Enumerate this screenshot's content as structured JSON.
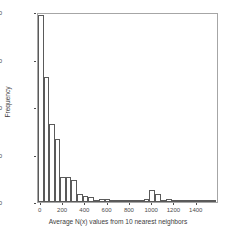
{
  "chart_data": {
    "type": "bar",
    "title": "",
    "subtitle": "",
    "xlabel": "Average N(x) values from 10 nearest neighbors",
    "ylabel": "Frequency",
    "xlim": [
      -25,
      1600
    ],
    "ylim": [
      0,
      10000
    ],
    "grid": false,
    "legend": null,
    "bin_width": 50,
    "xticks": [
      0,
      200,
      400,
      600,
      800,
      1000,
      1200,
      1400
    ],
    "xtick_labels": [
      "0",
      "200",
      "400",
      "600",
      "800",
      "1000",
      "1200",
      "1400"
    ],
    "yticks": [
      0,
      2500,
      5000,
      7500,
      10000
    ],
    "ytick_labels": [
      "0",
      "2500",
      "5000",
      "7500",
      "10000"
    ],
    "bar_style": {
      "fill": "#ffffff",
      "stroke": "#5a5a5a",
      "stroke_width": 1
    },
    "panel_border_color": "#a6a6a6",
    "background": "#ffffff",
    "categories": [
      "0",
      "50",
      "100",
      "150",
      "200",
      "250",
      "300",
      "350",
      "400",
      "450",
      "500",
      "550",
      "600",
      "650",
      "700",
      "750",
      "800",
      "850",
      "900",
      "950",
      "1000",
      "1050",
      "1100",
      "1150",
      "1200",
      "1250",
      "1300",
      "1350",
      "1400",
      "1450",
      "1500",
      "1550"
    ],
    "x": [
      0,
      50,
      100,
      150,
      200,
      250,
      300,
      350,
      400,
      450,
      500,
      550,
      600,
      650,
      700,
      750,
      800,
      850,
      900,
      950,
      1000,
      1050,
      1100,
      1150,
      1200,
      1250,
      1300,
      1350,
      1400,
      1450,
      1500,
      1550
    ],
    "values": [
      9850,
      6600,
      4080,
      3300,
      1320,
      1330,
      1180,
      420,
      300,
      290,
      120,
      140,
      150,
      60,
      40,
      30,
      30,
      40,
      60,
      160,
      640,
      400,
      130,
      140,
      120,
      100,
      110,
      60,
      40,
      30,
      30,
      20
    ]
  }
}
